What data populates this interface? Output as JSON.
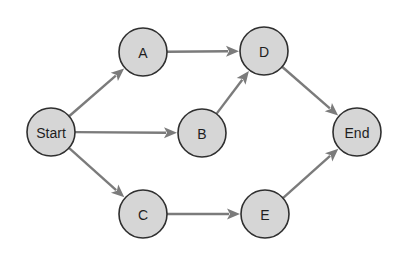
{
  "diagram": {
    "type": "directed-graph",
    "colors": {
      "node_fill": "#d6d6d6",
      "node_stroke": "#2f2f2f",
      "edge": "#7b7b7b",
      "background": "#ffffff"
    },
    "nodes": [
      {
        "id": "start",
        "label": "Start",
        "x": 51,
        "y": 132,
        "r": 24
      },
      {
        "id": "a",
        "label": "A",
        "x": 143,
        "y": 52,
        "r": 24
      },
      {
        "id": "b",
        "label": "B",
        "x": 202,
        "y": 133,
        "r": 24
      },
      {
        "id": "c",
        "label": "C",
        "x": 143,
        "y": 214,
        "r": 24
      },
      {
        "id": "d",
        "label": "D",
        "x": 264,
        "y": 51,
        "r": 24
      },
      {
        "id": "e",
        "label": "E",
        "x": 265,
        "y": 214,
        "r": 24
      },
      {
        "id": "end",
        "label": "End",
        "x": 357,
        "y": 132,
        "r": 24
      }
    ],
    "edges": [
      {
        "from": "start",
        "to": "a"
      },
      {
        "from": "start",
        "to": "b"
      },
      {
        "from": "start",
        "to": "c"
      },
      {
        "from": "a",
        "to": "d"
      },
      {
        "from": "b",
        "to": "d"
      },
      {
        "from": "c",
        "to": "e"
      },
      {
        "from": "d",
        "to": "end"
      },
      {
        "from": "e",
        "to": "end"
      }
    ]
  }
}
